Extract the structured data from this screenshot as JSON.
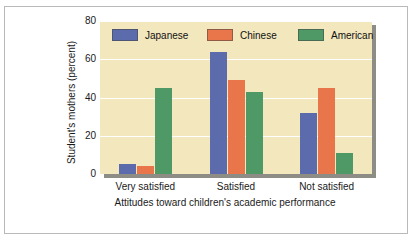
{
  "chart_data": {
    "type": "bar",
    "title": "",
    "subtitle": "",
    "categories": [
      "Very satisfied",
      "Satisfied",
      "Not satisfied"
    ],
    "series": [
      {
        "name": "Japanese",
        "color": "#5c6bab",
        "values": [
          5,
          64,
          32
        ]
      },
      {
        "name": "Chinese",
        "color": "#e8764a",
        "values": [
          4,
          49,
          45
        ]
      },
      {
        "name": "American",
        "color": "#4e9966",
        "values": [
          45,
          43,
          11
        ]
      }
    ],
    "xlabel": "Attitudes toward children's academic performance",
    "ylabel": "Student's mothers (percent)",
    "ylim": [
      0,
      80
    ],
    "yticks": [
      0,
      20,
      40,
      60,
      80
    ],
    "ytick_labels": [
      "0",
      "20",
      "40",
      "60",
      "80"
    ],
    "grid": true,
    "grid_color": "#ffffff",
    "legend_position": "top-inside",
    "plot_background": "#f2e7bd",
    "figure_background": "#ffffff",
    "axis_shadow_color": "#8d8d86",
    "frame_color": "#b9b9b9"
  },
  "legend": {
    "items": [
      {
        "label": "Japanese",
        "color": "#5c6bab"
      },
      {
        "label": "Chinese",
        "color": "#e8764a"
      },
      {
        "label": "American",
        "color": "#4e9966"
      }
    ]
  },
  "axes": {
    "y_title": "Student's mothers (percent)",
    "x_title": "Attitudes toward children's academic performance",
    "y_tick_labels": [
      "80",
      "60",
      "40",
      "20",
      "0"
    ],
    "x_tick_labels": [
      "Very satisfied",
      "Satisfied",
      "Not satisfied"
    ]
  }
}
